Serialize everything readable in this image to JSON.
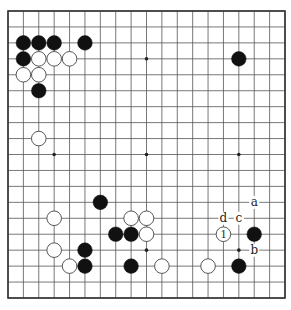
{
  "diagram": {
    "type": "go-board",
    "size": 19,
    "colors": {
      "background": "#ffffff",
      "line": "#555555",
      "border": "#333333",
      "black_stone": "#111111",
      "white_stone": "#ffffff",
      "white_stone_outline": "#444444"
    },
    "star_points": [
      [
        3,
        3
      ],
      [
        9,
        3
      ],
      [
        15,
        3
      ],
      [
        3,
        9
      ],
      [
        9,
        9
      ],
      [
        15,
        9
      ],
      [
        3,
        15
      ],
      [
        9,
        15
      ],
      [
        15,
        15
      ]
    ],
    "stones": [
      {
        "color": "black",
        "col": 1,
        "row": 2
      },
      {
        "color": "black",
        "col": 2,
        "row": 2
      },
      {
        "color": "black",
        "col": 3,
        "row": 2
      },
      {
        "color": "black",
        "col": 5,
        "row": 2
      },
      {
        "color": "black",
        "col": 1,
        "row": 3
      },
      {
        "color": "white",
        "col": 2,
        "row": 3
      },
      {
        "color": "white",
        "col": 3,
        "row": 3
      },
      {
        "color": "white",
        "col": 4,
        "row": 3
      },
      {
        "color": "white",
        "col": 1,
        "row": 4
      },
      {
        "color": "white",
        "col": 2,
        "row": 4
      },
      {
        "color": "black",
        "col": 2,
        "row": 5
      },
      {
        "color": "white",
        "col": 2,
        "row": 8
      },
      {
        "color": "black",
        "col": 15,
        "row": 3
      },
      {
        "color": "black",
        "col": 6,
        "row": 12
      },
      {
        "color": "white",
        "col": 3,
        "row": 13
      },
      {
        "color": "white",
        "col": 8,
        "row": 13
      },
      {
        "color": "white",
        "col": 9,
        "row": 13
      },
      {
        "color": "black",
        "col": 7,
        "row": 14
      },
      {
        "color": "black",
        "col": 8,
        "row": 14
      },
      {
        "color": "white",
        "col": 9,
        "row": 14
      },
      {
        "color": "white",
        "col": 14,
        "row": 14,
        "label": "1"
      },
      {
        "color": "black",
        "col": 16,
        "row": 14
      },
      {
        "color": "white",
        "col": 3,
        "row": 15
      },
      {
        "color": "black",
        "col": 5,
        "row": 15
      },
      {
        "color": "white",
        "col": 4,
        "row": 16
      },
      {
        "color": "black",
        "col": 5,
        "row": 16
      },
      {
        "color": "black",
        "col": 8,
        "row": 16
      },
      {
        "color": "white",
        "col": 10,
        "row": 16
      },
      {
        "color": "white",
        "col": 13,
        "row": 16
      },
      {
        "color": "black",
        "col": 15,
        "row": 16
      }
    ],
    "point_labels": [
      {
        "text": "a",
        "col": 16,
        "row": 12
      },
      {
        "text": "d",
        "col": 14,
        "row": 13
      },
      {
        "text": "c",
        "col": 15,
        "row": 13
      },
      {
        "text": "b",
        "col": 16,
        "row": 15
      }
    ]
  }
}
